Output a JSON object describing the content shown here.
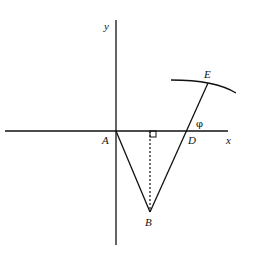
{
  "diagram": {
    "axes": {
      "x_label": "x",
      "y_label": "y"
    },
    "points": {
      "A": "A",
      "B": "B",
      "D": "D",
      "E": "E"
    },
    "angle_label": "φ",
    "segments": [
      "AB",
      "BD",
      "DE"
    ],
    "dashed_perpendicular": "from B to x-axis",
    "right_angle_marker": true,
    "arc": "curve through E"
  }
}
